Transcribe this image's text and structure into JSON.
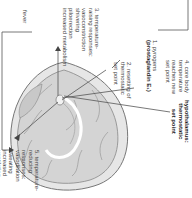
{
  "diagram": {
    "title_label": {
      "line1": "hypothalamus:",
      "line2": "thermostatic",
      "line3": "set point"
    },
    "steps": [
      {
        "number": "1.",
        "lines": [
          "pyrogens",
          "(prostaglandin E₁)"
        ],
        "bold_line": 1
      },
      {
        "number": "2.",
        "lines": [
          "resetting of",
          "thermostatic",
          "set point"
        ]
      },
      {
        "number": "3.",
        "lines": [
          "temperature-",
          "raising responses:",
          "vasoconstriction",
          "shivering",
          "piloerection",
          "increased metabolism"
        ]
      },
      {
        "number": "4.",
        "lines": [
          "core body",
          "temperature",
          "reaches new",
          "set point"
        ]
      },
      {
        "number": "5.",
        "lines": [
          "temperature-",
          "reducing",
          "responses:",
          "vasodilation",
          "sweating",
          "increased",
          "ventilation"
        ]
      }
    ],
    "outcome_label": "fever",
    "colors": {
      "brain_fill": "#d9d9d9",
      "brain_dark": "#a8a8a8",
      "line": "#555555",
      "text": "#444444"
    }
  }
}
